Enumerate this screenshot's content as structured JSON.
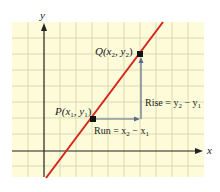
{
  "diagram": {
    "title": "",
    "axes": {
      "x_label": "x",
      "y_label": "y"
    },
    "points": {
      "P": {
        "label": "P",
        "coord_label": "(x",
        "sub1": "1",
        "mid": ", y",
        "sub2": "1",
        "close": ")"
      },
      "Q": {
        "label": "Q",
        "coord_label": "(x",
        "sub1": "2",
        "mid": ", y",
        "sub2": "2",
        "close": ")"
      }
    },
    "run": {
      "text": "Run = x",
      "sub1": "2",
      "minus": " − x",
      "sub2": "1"
    },
    "rise": {
      "text": "Rise = y",
      "sub1": "2",
      "minus": " − y",
      "sub2": "1"
    },
    "colors": {
      "grid_bg": "#fdfbd9",
      "grid_line": "#d9dbb0",
      "line": "#d7261e",
      "axis": "#222222",
      "arrow": "#5a6b8c"
    }
  }
}
